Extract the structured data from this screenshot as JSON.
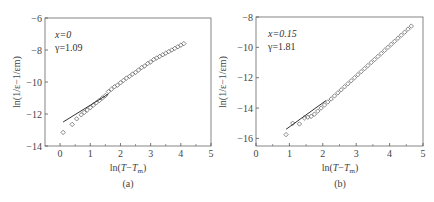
{
  "chart_data": [
    {
      "id": "a",
      "type": "scatter",
      "caption": "(a)",
      "title": "",
      "xlabel": "ln(T−Tm)",
      "ylabel": "ln(1/ε−1/εm)",
      "xlim": [
        -0.5,
        5
      ],
      "ylim": [
        -14,
        -6
      ],
      "xticks": [
        0,
        1,
        2,
        3,
        4,
        5
      ],
      "yticks": [
        -14,
        -12,
        -10,
        -8,
        -6
      ],
      "annotation": [
        "x=0",
        "γ=1.09"
      ],
      "grid": false,
      "legend": null,
      "marker": "open-diamond",
      "series": [
        {
          "name": "data",
          "x": [
            0.1,
            0.4,
            0.55,
            0.7,
            0.8,
            0.9,
            1.0,
            1.1,
            1.2,
            1.3,
            1.4,
            1.5,
            1.6,
            1.7,
            1.8,
            1.9,
            2.0,
            2.1,
            2.2,
            2.3,
            2.4,
            2.5,
            2.6,
            2.7,
            2.8,
            2.9,
            3.0,
            3.1,
            3.2,
            3.3,
            3.4,
            3.5,
            3.6,
            3.7,
            3.8,
            3.9,
            4.0,
            4.1
          ],
          "y": [
            -13.15,
            -12.65,
            -12.3,
            -12.05,
            -11.9,
            -11.75,
            -11.6,
            -11.45,
            -11.3,
            -11.15,
            -11.0,
            -10.85,
            -10.6,
            -10.45,
            -10.3,
            -10.2,
            -10.05,
            -9.9,
            -9.75,
            -9.65,
            -9.5,
            -9.4,
            -9.25,
            -9.1,
            -9.0,
            -8.85,
            -8.75,
            -8.6,
            -8.5,
            -8.4,
            -8.3,
            -8.2,
            -8.1,
            -8.0,
            -7.9,
            -7.8,
            -7.7,
            -7.6
          ]
        },
        {
          "name": "fit",
          "type": "line",
          "x": [
            0.1,
            1.6
          ],
          "y": [
            -12.5,
            -10.75
          ]
        }
      ]
    },
    {
      "id": "b",
      "type": "scatter",
      "caption": "(b)",
      "title": "",
      "xlabel": "ln(T−Tm)",
      "ylabel": "ln(1/ε−1/εm)",
      "xlim": [
        0,
        5
      ],
      "ylim": [
        -16.5,
        -8
      ],
      "xticks": [
        0,
        1,
        2,
        3,
        4,
        5
      ],
      "yticks": [
        -16,
        -14,
        -12,
        -10,
        -8
      ],
      "annotation": [
        "x=0.15",
        "γ=1.81"
      ],
      "grid": false,
      "legend": null,
      "marker": "open-diamond",
      "series": [
        {
          "name": "data",
          "x": [
            0.9,
            1.1,
            1.3,
            1.45,
            1.55,
            1.65,
            1.75,
            1.85,
            1.95,
            2.05,
            2.15,
            2.25,
            2.35,
            2.45,
            2.55,
            2.65,
            2.75,
            2.85,
            2.95,
            3.05,
            3.15,
            3.25,
            3.35,
            3.45,
            3.55,
            3.65,
            3.75,
            3.85,
            3.95,
            4.05,
            4.15,
            4.25,
            4.35,
            4.45,
            4.55,
            4.65
          ],
          "y": [
            -15.75,
            -15.0,
            -15.05,
            -14.65,
            -14.6,
            -14.55,
            -14.4,
            -14.2,
            -14.0,
            -13.8,
            -13.6,
            -13.4,
            -13.2,
            -13.0,
            -12.8,
            -12.6,
            -12.4,
            -12.2,
            -12.0,
            -11.8,
            -11.6,
            -11.4,
            -11.2,
            -11.0,
            -10.8,
            -10.6,
            -10.4,
            -10.2,
            -10.0,
            -9.8,
            -9.6,
            -9.4,
            -9.2,
            -9.0,
            -8.8,
            -8.6
          ]
        },
        {
          "name": "fit",
          "type": "line",
          "x": [
            0.9,
            2.1
          ],
          "y": [
            -15.4,
            -13.5
          ]
        }
      ]
    }
  ],
  "panels": {
    "a": {
      "caption": "(a)",
      "xlabel_prefix": "ln(",
      "xlabel_T": "T",
      "xlabel_dash": "−",
      "xlabel_Tm": "T",
      "xlabel_sub": "m",
      "xlabel_suffix": ")",
      "ylabel": "ln(1/ε−1/εm)",
      "annot_x": "x=0",
      "annot_g": "γ=1.09"
    },
    "b": {
      "caption": "(b)",
      "xlabel_prefix": "ln(",
      "xlabel_T": "T",
      "xlabel_dash": "−",
      "xlabel_Tm": "T",
      "xlabel_sub": "m",
      "xlabel_suffix": ")",
      "ylabel": "ln(1/ε−1/εm)",
      "annot_x": "x=0.15",
      "annot_g": "γ=1.81"
    }
  },
  "colors": {
    "axis": "#555555",
    "marker": "#555555",
    "line": "#333333"
  }
}
